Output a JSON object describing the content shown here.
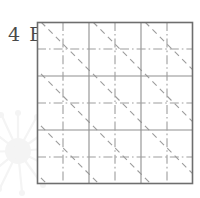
{
  "figure": {
    "label": "4 B",
    "type": "engineering-hatch-grid"
  },
  "watermark": {
    "name": "dandelion-flower-watermark",
    "color": "#f3f3f3"
  },
  "colors": {
    "border": "#6e6e6e",
    "grid_line": "#8c8c8c",
    "center_line": "#9a9a9a",
    "diagonal_line": "#9a9a9a",
    "background": "#ffffff",
    "label_text": "#4a4a4a"
  },
  "drawing": {
    "frame": {
      "x": 37,
      "y": 22,
      "width": 156,
      "height": 162
    },
    "grid": {
      "columns": 3,
      "rows": 3,
      "vertical_lines_x": [
        89,
        141
      ],
      "horizontal_lines_y": [
        76,
        130
      ]
    },
    "center_lines": {
      "vertical_x": [
        63,
        115,
        167
      ],
      "horizontal_y": [
        49,
        103,
        157
      ],
      "pattern": "dash-dot"
    },
    "diagonals": {
      "direction": "top-left-to-bottom-right",
      "count": 7,
      "pattern": "dashed",
      "spacing": 52
    }
  }
}
